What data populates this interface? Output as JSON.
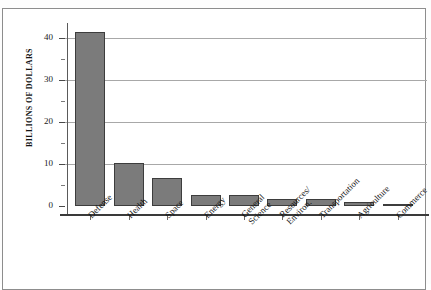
{
  "figure": {
    "top_caption": "",
    "background_color": "#ffffff",
    "border_color": "#8d8d8d"
  },
  "axis": {
    "y_label": "BILLIONS OF DOLLARS",
    "y_ticks": [
      "0",
      "10",
      "20",
      "30",
      "40"
    ]
  },
  "chart_data": {
    "type": "bar",
    "title": "",
    "xlabel": "",
    "ylabel": "BILLIONS OF DOLLARS",
    "ylim": [
      0,
      44.5
    ],
    "yticks": [
      0,
      10,
      20,
      30,
      40
    ],
    "minor_ticks": [
      5,
      15,
      25,
      35
    ],
    "grid": true,
    "grid_axis": "y",
    "legend": "none",
    "bar_color": "#7b7b7b",
    "bar_edge_color": "#3d3d3d",
    "categories": [
      "Defense",
      "Health",
      "Space",
      "Energy",
      "General Science",
      "Resources/ Environ.",
      "Transportation",
      "Agriculture",
      "Commerce"
    ],
    "values": [
      41.5,
      10.3,
      6.6,
      2.6,
      2.6,
      1.7,
      1.7,
      1.0,
      0.4
    ]
  },
  "bars": [
    {
      "label": "Defense",
      "label_lines": [
        "Defense"
      ],
      "value": 41.5
    },
    {
      "label": "Health",
      "label_lines": [
        "Health"
      ],
      "value": 10.3
    },
    {
      "label": "Space",
      "label_lines": [
        "Space"
      ],
      "value": 6.6
    },
    {
      "label": "Energy",
      "label_lines": [
        "Energy"
      ],
      "value": 2.6
    },
    {
      "label": "General Science",
      "label_lines": [
        "General",
        "Science"
      ],
      "value": 2.6
    },
    {
      "label": "Resources/ Environ.",
      "label_lines": [
        "Resources/",
        "Environ."
      ],
      "value": 1.7
    },
    {
      "label": "Transportation",
      "label_lines": [
        "Transportation"
      ],
      "value": 1.7
    },
    {
      "label": "Agriculture",
      "label_lines": [
        "Agriculture"
      ],
      "value": 1.0
    },
    {
      "label": "Commerce",
      "label_lines": [
        "Commerce"
      ],
      "value": 0.4
    }
  ]
}
